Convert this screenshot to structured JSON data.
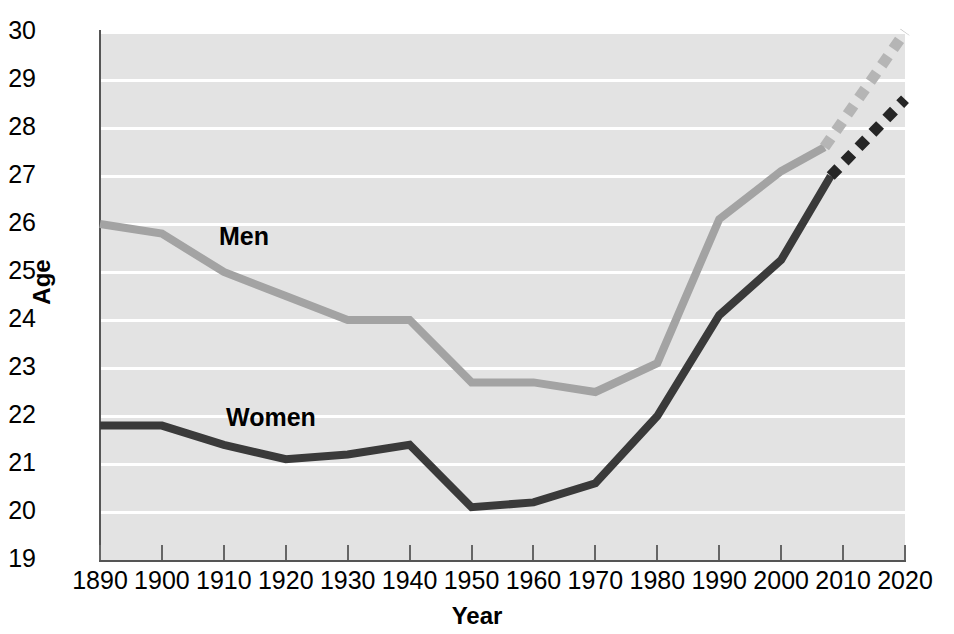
{
  "chart_data": {
    "type": "line",
    "title": "",
    "xlabel": "Year",
    "ylabel": "Age",
    "xlim": [
      1890,
      2020
    ],
    "ylim": [
      19,
      30
    ],
    "grid": true,
    "legend_position": "inline-annotation",
    "x_ticks": [
      1890,
      1900,
      1910,
      1920,
      1930,
      1940,
      1950,
      1960,
      1970,
      1980,
      1990,
      2000,
      2010,
      2020
    ],
    "y_ticks": [
      19,
      20,
      21,
      22,
      23,
      24,
      25,
      26,
      27,
      28,
      29,
      30
    ],
    "series": [
      {
        "name": "Men",
        "color": "#a3a3a3",
        "style": "solid",
        "x": [
          1890,
          1900,
          1910,
          1920,
          1930,
          1940,
          1950,
          1960,
          1970,
          1980,
          1990,
          2000,
          2007
        ],
        "values": [
          26.0,
          25.8,
          25.0,
          24.5,
          24.0,
          24.0,
          22.7,
          22.7,
          22.5,
          23.1,
          26.1,
          27.1,
          27.6
        ]
      },
      {
        "name": "Men projected",
        "color": "#b5b5b5",
        "style": "dotted",
        "x": [
          2007,
          2020
        ],
        "values": [
          27.6,
          30.0
        ]
      },
      {
        "name": "Women",
        "color": "#3a3a3a",
        "style": "solid",
        "x": [
          1890,
          1900,
          1910,
          1920,
          1930,
          1940,
          1950,
          1960,
          1970,
          1980,
          1990,
          2000,
          2008
        ],
        "values": [
          21.8,
          21.8,
          21.4,
          21.1,
          21.2,
          21.4,
          20.1,
          20.2,
          20.6,
          22.0,
          24.1,
          25.25,
          27.0
        ]
      },
      {
        "name": "Women projected",
        "color": "#262626",
        "style": "dotted",
        "x": [
          2008,
          2020
        ],
        "values": [
          27.0,
          28.6
        ]
      }
    ],
    "annotations": [
      {
        "text": "Men",
        "x": 1905,
        "y": 25.5
      },
      {
        "text": "Women",
        "x": 1907,
        "y": 22.0
      }
    ],
    "colors": {
      "plot_background": "#e3e3e3",
      "gridline": "#ffffff",
      "axis": "#555555",
      "men_line": "#a3a3a3",
      "women_line": "#3a3a3a"
    }
  }
}
